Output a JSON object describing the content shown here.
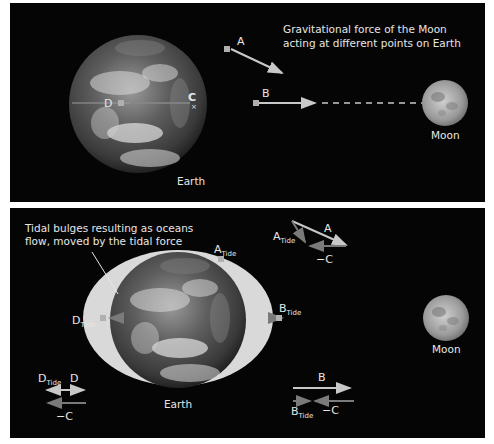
{
  "top_panel": {
    "caption_line1": "Gravitational force of the Moon",
    "caption_line2": "acting at different points on Earth",
    "earth_label": "Earth",
    "moon_label": "Moon",
    "points": {
      "A": "A",
      "B": "B",
      "C": "C",
      "D": "D"
    }
  },
  "bottom_panel": {
    "caption_line1": "Tidal bulges resulting as oceans",
    "caption_line2": "flow, moved by the tidal force",
    "earth_label": "Earth",
    "moon_label": "Moon",
    "tide_points": {
      "A_main": "A",
      "B_main": "B",
      "D_main": "D",
      "sub": "Tide"
    },
    "vector_diagrams": {
      "A": {
        "vector": "A",
        "tide_main": "A",
        "tide_sub": "Tide",
        "neg_c": "−C"
      },
      "B": {
        "vector": "B",
        "tide_main": "B",
        "tide_sub": "Tide",
        "neg_c": "−C"
      },
      "D": {
        "vector": "D",
        "tide_main": "D",
        "tide_sub": "Tide",
        "neg_c": "−C"
      }
    }
  },
  "colors": {
    "background": "#050505",
    "page": "#ffffff",
    "arrow_light": "#c8c8c8",
    "arrow_dark": "#7a7a7a",
    "bulge": "#d9d9d9",
    "marker": "#b0b0b0",
    "text": "#e6e6e6"
  }
}
